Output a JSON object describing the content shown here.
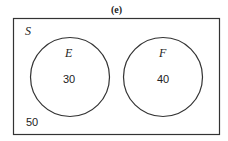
{
  "title": "(e)",
  "universe": {
    "label": "S",
    "outside_value": "50"
  },
  "sets": [
    {
      "label": "E",
      "value": "30"
    },
    {
      "label": "F",
      "value": "40"
    }
  ],
  "colors": {
    "stroke": "#333333",
    "text": "#222222",
    "background": "#ffffff"
  }
}
